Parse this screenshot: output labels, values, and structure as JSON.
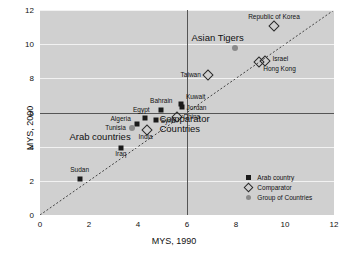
{
  "chart_data": {
    "type": "scatter",
    "title": "",
    "xlabel": "MYS, 1990",
    "ylabel": "MYS, 2000",
    "xlim": [
      0,
      12
    ],
    "ylim": [
      0,
      12
    ],
    "xticks": [
      0,
      2,
      4,
      6,
      8,
      10,
      12
    ],
    "yticks": [
      0,
      2,
      4,
      6,
      8,
      10,
      12
    ],
    "grid": true,
    "reference_lines": {
      "horizontal_y": 6,
      "vertical_x": 6,
      "diagonal": "y = x"
    },
    "legend": {
      "position": "bottom-right",
      "entries": [
        {
          "label": "Arab country",
          "marker": "filled-square",
          "color": "#1a1a1a"
        },
        {
          "label": "Comparator",
          "marker": "open-diamond",
          "color": "#2a2a2a"
        },
        {
          "label": "Group of Countries",
          "marker": "filled-circle",
          "color": "#8a8a8a"
        }
      ]
    },
    "annotations": [
      {
        "text": "Asian Tigers",
        "x": 7.25,
        "y": 10.35
      },
      {
        "text": "Arab countries",
        "x": 2.45,
        "y": 4.55
      },
      {
        "text": "Comparator\nCountries",
        "x": 5.9,
        "y": 5.35
      }
    ],
    "points": [
      {
        "name": "Republic of Korea",
        "x": 9.55,
        "y": 11.05,
        "series": "Comparator",
        "label_dx": 0,
        "label_dy": -8,
        "label_align": "center"
      },
      {
        "name": "Asian Tigers",
        "x": 7.95,
        "y": 9.75,
        "series": "Group of Countries",
        "label_dx": 0,
        "label_dy": -99,
        "label_align": "center"
      },
      {
        "name": "Israel",
        "x": 9.2,
        "y": 9.0,
        "series": "Comparator",
        "label_dx": 7,
        "label_dy": -1,
        "label_align": "left"
      },
      {
        "name": "Hong Kong",
        "x": 8.95,
        "y": 8.95,
        "series": "Comparator",
        "label_dx": 4,
        "label_dy": 8,
        "label_align": "left"
      },
      {
        "name": "Taiwan",
        "x": 6.85,
        "y": 8.2,
        "series": "Comparator",
        "label_dx": -7,
        "label_dy": 1,
        "label_align": "right"
      },
      {
        "name": "Kuwait",
        "x": 5.75,
        "y": 6.5,
        "series": "Arab country",
        "label_dx": 5,
        "label_dy": -6,
        "label_align": "left"
      },
      {
        "name": "Jordan",
        "x": 5.78,
        "y": 6.3,
        "series": "Arab country",
        "label_dx": 5,
        "label_dy": 2,
        "label_align": "left"
      },
      {
        "name": "China",
        "x": 5.6,
        "y": 5.75,
        "series": "Comparator",
        "label_dx": 6,
        "label_dy": 1,
        "label_align": "left"
      },
      {
        "name": "Bahrain",
        "x": 4.95,
        "y": 6.15,
        "series": "Arab country",
        "label_dx": 0,
        "label_dy": -8,
        "label_align": "center"
      },
      {
        "name": "Egypt",
        "x": 4.3,
        "y": 5.7,
        "series": "Arab country",
        "label_dx": -4,
        "label_dy": -7,
        "label_align": "center"
      },
      {
        "name": "Syria",
        "x": 4.72,
        "y": 5.55,
        "series": "Arab country",
        "label_dx": 5,
        "label_dy": 2,
        "label_align": "left"
      },
      {
        "name": "Algeria",
        "x": 3.95,
        "y": 5.3,
        "series": "Arab country",
        "label_dx": -6,
        "label_dy": -4,
        "label_align": "right"
      },
      {
        "name": "Tunisia",
        "x": 3.75,
        "y": 5.1,
        "series": "Group of Countries",
        "label_dx": -6,
        "label_dy": 1,
        "label_align": "right"
      },
      {
        "name": "India",
        "x": 4.35,
        "y": 4.95,
        "series": "Comparator",
        "label_dx": -1,
        "label_dy": 8,
        "label_align": "center"
      },
      {
        "name": "Iraq",
        "x": 3.3,
        "y": 3.95,
        "series": "Arab country",
        "label_dx": 0,
        "label_dy": 7,
        "label_align": "center"
      },
      {
        "name": "Sudan",
        "x": 1.62,
        "y": 2.1,
        "series": "Arab country",
        "label_dx": 0,
        "label_dy": -8,
        "label_align": "center"
      }
    ]
  }
}
